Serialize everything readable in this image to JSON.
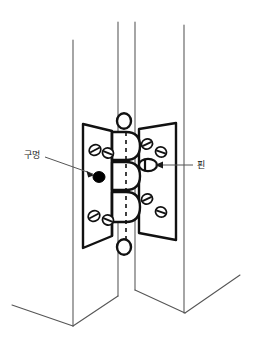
{
  "figure": {
    "kind": "technical-line-drawing",
    "background_color": "#ffffff",
    "line_color": "#1a1a1a",
    "thin_line_color": "#555555",
    "fill_color": "#ffffff",
    "hole_color": "#000000"
  },
  "labels": {
    "hole": {
      "text": "구멍",
      "x": 28,
      "y": 155,
      "leader_from_x": 45,
      "leader_from_y": 157,
      "leader_to_x": 93,
      "leader_to_y": 174
    },
    "pin": {
      "text": "핀",
      "x": 196,
      "y": 163,
      "leader_from_x": 193,
      "leader_from_y": 165,
      "leader_to_x": 153,
      "leader_to_y": 165
    }
  },
  "door_frame": {
    "vertical_lines": [
      {
        "name": "left-door-outer-edge",
        "x1": 73,
        "y1": 40,
        "x2": 73,
        "y2": 326
      },
      {
        "name": "left-door-inner-edge",
        "x1": 118,
        "y1": 22,
        "x2": 118,
        "y2": 296
      },
      {
        "name": "right-door-inner-edge",
        "x1": 135,
        "y1": 22,
        "x2": 135,
        "y2": 290
      },
      {
        "name": "right-door-outer-edge",
        "x1": 184,
        "y1": 25,
        "x2": 184,
        "y2": 313
      }
    ],
    "bottom_edges": [
      {
        "name": "left-door-bottom-front",
        "x1": 12,
        "y1": 305,
        "x2": 73,
        "y2": 326
      },
      {
        "name": "left-door-bottom-back",
        "x1": 73,
        "y1": 326,
        "x2": 118,
        "y2": 296
      },
      {
        "name": "right-door-bottom-back",
        "x1": 135,
        "y1": 290,
        "x2": 185,
        "y2": 313
      },
      {
        "name": "right-door-bottom-front",
        "x1": 185,
        "y1": 313,
        "x2": 240,
        "y2": 275
      }
    ]
  },
  "hinge": {
    "left_leaf": {
      "name": "left-hinge-leaf",
      "outline": "M 83,124 L 112,131 L 112,236 L 83,248 Z",
      "screws": [
        {
          "cx": 95,
          "cy": 150,
          "rx": 6.0,
          "ry": 5.2,
          "angle": -28
        },
        {
          "cx": 108,
          "cy": 153,
          "rx": 5.6,
          "ry": 5.0,
          "angle": 22
        },
        {
          "cx": 94,
          "cy": 216,
          "rx": 6.0,
          "ry": 5.2,
          "angle": -28
        },
        {
          "cx": 108,
          "cy": 220,
          "rx": 5.6,
          "ry": 5.0,
          "angle": 22
        }
      ],
      "hole": {
        "name": "hinge-hole",
        "cx": 99,
        "cy": 177,
        "rx": 6.0,
        "ry": 5.4
      }
    },
    "right_leaf": {
      "name": "right-hinge-leaf",
      "outline": "M 139,129 L 176,123 L 176,240 L 139,233 Z",
      "screws": [
        {
          "cx": 147,
          "cy": 144,
          "rx": 5.6,
          "ry": 5.0,
          "angle": -25
        },
        {
          "cx": 161,
          "cy": 152,
          "rx": 5.6,
          "ry": 5.0,
          "angle": 20
        },
        {
          "cx": 147,
          "cy": 199,
          "rx": 5.6,
          "ry": 5.0,
          "angle": -25
        },
        {
          "cx": 161,
          "cy": 212,
          "rx": 5.6,
          "ry": 5.0,
          "angle": 20
        }
      ],
      "pin_detail": {
        "name": "hinge-pin",
        "cx": 148,
        "cy": 165,
        "rx": 9.0,
        "ry": 6.2
      }
    },
    "knuckle_axis": {
      "x": 123,
      "top": 123,
      "bottom": 246
    },
    "pin_caps": [
      {
        "name": "hinge-pin-cap-top",
        "cx": 124,
        "cy": 121,
        "rx": 7.0,
        "ry": 7.8
      },
      {
        "name": "hinge-pin-cap-bottom",
        "cx": 124,
        "cy": 247,
        "rx": 7.0,
        "ry": 7.8
      }
    ],
    "knuckles": [
      {
        "name": "knuckle-1",
        "y_top": 131,
        "y_bottom": 160,
        "side": "right"
      },
      {
        "name": "knuckle-2",
        "y_top": 160,
        "y_bottom": 190,
        "side": "right"
      },
      {
        "name": "knuckle-3",
        "y_top": 190,
        "y_bottom": 222,
        "side": "right"
      }
    ],
    "centerline": {
      "name": "hinge-centerline",
      "x": 126,
      "y1": 124,
      "y2": 246,
      "style": "dashed"
    }
  }
}
